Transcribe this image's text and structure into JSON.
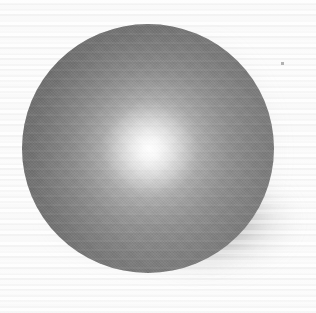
{
  "canvas": {
    "width": 316,
    "height": 313,
    "background_color": "#f8f8f8",
    "description": "Computer-rendered shaded gray sphere on a near-white background with a soft cast shadow spreading to the right and lower-right."
  },
  "subject": {
    "name": "sphere",
    "shape": "sphere",
    "center_x": 148,
    "center_y": 148,
    "radius": 125,
    "bounds": {
      "left": 22,
      "top": 24,
      "width": 252,
      "height": 249
    },
    "surface": "matte-to-semigloss gray, smooth radial falloff with visible dither and horizontal banding artifacts"
  },
  "shading": {
    "light_direction": "front, slightly left of center and above",
    "highlight_x": 150,
    "highlight_y": 149,
    "highlight_color": "#fbfbfb",
    "midtone_color": "#9c9c9c",
    "terminator_color": "#858585",
    "rim_color_right": "#7a7a7a",
    "rim_color_left": "#636363",
    "darkest_color": "#5f5f5f"
  },
  "shadow": {
    "type": "soft diffuse cast shadow",
    "direction": "right and lower-right",
    "color": "#6e6e6e",
    "max_opacity": 0.5,
    "blur_px": 8,
    "fades_to": "#ffffff"
  },
  "artifacts": {
    "horizontal_banding": true,
    "dither_crosshatch": true,
    "speck": {
      "x": 281,
      "y": 62,
      "size": 3,
      "color": "#b2b2b2"
    }
  },
  "text_content": {
    "has_text": false,
    "labels": []
  }
}
